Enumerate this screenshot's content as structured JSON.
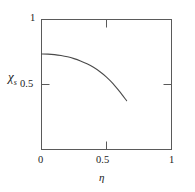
{
  "chart_data": {
    "type": "line",
    "title": "",
    "xlabel": "η",
    "ylabel": "χ",
    "ylabel_subscript": "s",
    "xlim": [
      0,
      1
    ],
    "ylim": [
      0,
      1
    ],
    "grid": false,
    "legend": null,
    "xticks": [
      0,
      0.5,
      1
    ],
    "xtick_labels": [
      "0",
      "0.5",
      "1"
    ],
    "yticks": [
      0.5,
      1
    ],
    "ytick_labels": [
      "0.5",
      "1"
    ],
    "series": [
      {
        "name": "χs vs η",
        "x": [
          0.0,
          0.05,
          0.1,
          0.15,
          0.2,
          0.25,
          0.3,
          0.35,
          0.4,
          0.45,
          0.5,
          0.55,
          0.6,
          0.655
        ],
        "y": [
          0.735,
          0.734,
          0.73,
          0.723,
          0.713,
          0.699,
          0.681,
          0.659,
          0.632,
          0.598,
          0.557,
          0.507,
          0.447,
          0.375
        ]
      }
    ]
  },
  "axes": {
    "top_tick_x": 0.5,
    "right_tick_y": 0.5,
    "frame_color": "#555555",
    "curve_color": "#4a4a4a"
  }
}
